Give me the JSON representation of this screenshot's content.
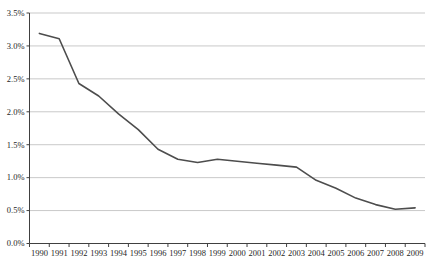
{
  "chart_data": {
    "type": "line",
    "title": "",
    "xlabel": "",
    "ylabel": "",
    "x": [
      "1990",
      "1991",
      "1992",
      "1993",
      "1994",
      "1995",
      "1996",
      "1997",
      "1998",
      "1999",
      "2000",
      "2001",
      "2002",
      "2003",
      "2004",
      "2005",
      "2006",
      "2007",
      "2008",
      "2009"
    ],
    "series": [
      {
        "name": "rate",
        "values": [
          3.19,
          3.11,
          2.43,
          2.24,
          1.97,
          1.73,
          1.43,
          1.28,
          1.23,
          1.28,
          1.25,
          1.22,
          1.19,
          1.16,
          0.96,
          0.84,
          0.69,
          0.59,
          0.52,
          0.54
        ]
      }
    ],
    "ylim": [
      0,
      3.5
    ],
    "ytick_step": 0.5,
    "ytick_labels": [
      "0.0%",
      "0.5%",
      "1.0%",
      "1.5%",
      "2.0%",
      "2.5%",
      "3.0%",
      "3.5%"
    ],
    "grid": "horizontal",
    "legend_position": "none",
    "colors": {
      "line": "#4d4d4d",
      "gridline": "#c9c9c9",
      "axis": "#404040",
      "label_text": "#1f1f1f",
      "background": "#ffffff"
    }
  }
}
